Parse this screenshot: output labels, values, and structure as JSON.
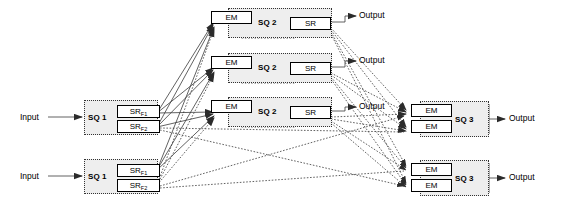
{
  "diagram": {
    "type": "block-diagram",
    "labels": {
      "input": "Input",
      "output": "Output",
      "sq1": "SQ 1",
      "sq2": "SQ 2",
      "sq3": "SQ 3",
      "em": "EM",
      "sr": "SR",
      "sr_f1_base": "SR",
      "sr_f1_sub": "F1",
      "sr_f2_base": "SR",
      "sr_f2_sub": "F2"
    },
    "colors": {
      "group_fill": "#eeeeee",
      "group_border": "#333333",
      "unit_fill": "#ffffff",
      "unit_border": "#000000",
      "wire": "#444444",
      "text": "#000000"
    },
    "stage1_blocks": [
      {
        "id": "sq1-top",
        "label": "SQ 1",
        "input_label": "Input",
        "units": [
          {
            "id": "sq1-top-srf1",
            "base": "SR",
            "sub": "F1"
          },
          {
            "id": "sq1-top-srf2",
            "base": "SR",
            "sub": "F2"
          }
        ]
      },
      {
        "id": "sq1-bottom",
        "label": "SQ 1",
        "input_label": "Input",
        "units": [
          {
            "id": "sq1-bottom-srf1",
            "base": "SR",
            "sub": "F1"
          },
          {
            "id": "sq1-bottom-srf2",
            "base": "SR",
            "sub": "F2"
          }
        ]
      }
    ],
    "stage2_blocks": [
      {
        "id": "sq2-1",
        "label": "SQ 2",
        "em": "EM",
        "sr": "SR",
        "output_label": "Output"
      },
      {
        "id": "sq2-2",
        "label": "SQ 2",
        "em": "EM",
        "sr": "SR",
        "output_label": "Output"
      },
      {
        "id": "sq2-3",
        "label": "SQ 2",
        "em": "EM",
        "sr": "SR",
        "output_label": "Output"
      }
    ],
    "stage3_blocks": [
      {
        "id": "sq3-top",
        "label": "SQ 3",
        "output_label": "Output",
        "units": [
          {
            "id": "sq3-top-em1",
            "label": "EM"
          },
          {
            "id": "sq3-top-em2",
            "label": "EM"
          }
        ]
      },
      {
        "id": "sq3-bottom",
        "label": "SQ 3",
        "output_label": "Output",
        "units": [
          {
            "id": "sq3-bottom-em1",
            "label": "EM"
          },
          {
            "id": "sq3-bottom-em2",
            "label": "EM"
          }
        ]
      }
    ]
  }
}
